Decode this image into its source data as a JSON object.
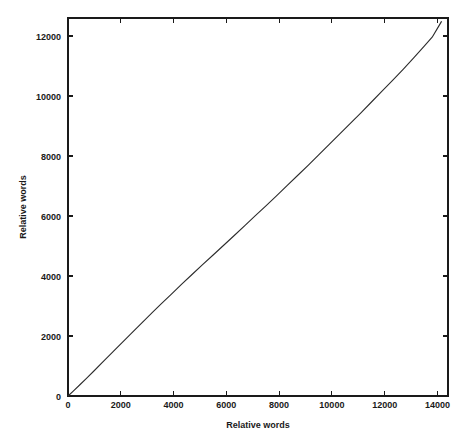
{
  "chart_data": {
    "type": "line",
    "title": "",
    "subtitle": "",
    "xlabel": "Relative words",
    "ylabel": "Relative words",
    "xlim": [
      0,
      14400
    ],
    "ylim": [
      0,
      12600
    ],
    "xticks": [
      0,
      2000,
      4000,
      6000,
      8000,
      10000,
      12000,
      14000
    ],
    "xticklabels": [
      "0",
      "2000",
      "4000",
      "6000",
      "8000",
      "10000",
      "12000",
      "14000"
    ],
    "yticks": [
      0,
      2000,
      4000,
      6000,
      8000,
      10000,
      12000
    ],
    "yticklabels": [
      "0",
      "2000",
      "4000",
      "6000",
      "8000",
      "10000",
      "12000"
    ],
    "grid": false,
    "legend": null,
    "legend_position": "none",
    "line_color": "#2b2b2b",
    "frame_color": "#1a1a1a",
    "background_color": "#ffffff",
    "annotations": [],
    "series": [
      {
        "name": "Relative words",
        "x": [
          0,
          200,
          450,
          700,
          1000,
          1350,
          1700,
          2050,
          2400,
          2800,
          3200,
          3550,
          3900,
          4300,
          4700,
          5100,
          5500,
          5900,
          6300,
          6700,
          7100,
          7500,
          7900,
          8300,
          8700,
          9100,
          9500,
          9900,
          10300,
          10700,
          11100,
          11500,
          11900,
          12300,
          12700,
          13100,
          13500,
          13800,
          14050,
          14150
        ],
        "y": [
          0,
          165,
          375,
          590,
          850,
          1160,
          1470,
          1780,
          2085,
          2440,
          2790,
          3090,
          3380,
          3720,
          4050,
          4380,
          4700,
          5025,
          5350,
          5680,
          6010,
          6340,
          6670,
          7010,
          7350,
          7690,
          8035,
          8385,
          8735,
          9085,
          9440,
          9800,
          10160,
          10520,
          10890,
          11270,
          11660,
          11960,
          12330,
          12480
        ]
      }
    ]
  }
}
